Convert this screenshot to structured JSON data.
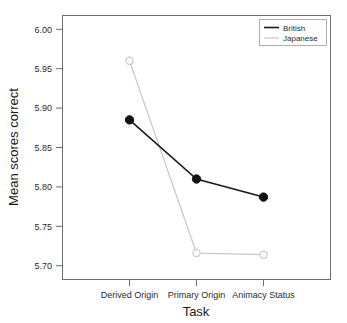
{
  "chart_data": {
    "type": "line",
    "title": "",
    "xlabel": "Task",
    "ylabel": "Mean scores correct",
    "categories": [
      "Derived Origin",
      "Primary Origin",
      "Animacy Status"
    ],
    "yticks": [
      "5.70",
      "5.75",
      "5.80",
      "5.85",
      "5.90",
      "5.95",
      "6.00"
    ],
    "ylim": [
      5.6825,
      6.0175
    ],
    "grid": false,
    "legend_position": "top-right",
    "series": [
      {
        "name": "British",
        "values": [
          5.885,
          5.81,
          5.787
        ],
        "color": "#1a1a1a",
        "marker": "filled-circle"
      },
      {
        "name": "Japanese",
        "values": [
          5.96,
          5.716,
          5.714
        ],
        "color": "#c8c8c8",
        "marker": "open-circle"
      }
    ]
  }
}
